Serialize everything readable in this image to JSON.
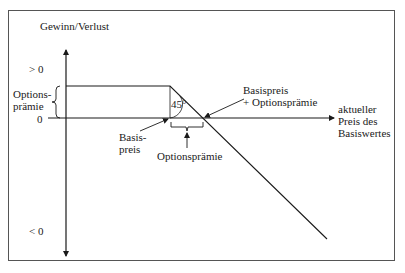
{
  "diagram": {
    "type": "payoff-diagram",
    "y_axis_label": "Gewinn/Verlust",
    "x_axis_label": "aktueller\nPreis des\nBasiswertes",
    "tick_positive": "> 0",
    "tick_zero": "0",
    "tick_negative": "< 0",
    "bracket_left_label": "Options-\nprämie",
    "angle_label": "45°",
    "strike_label": "Basis-\npreis",
    "breakeven_label": "Basispreis\n+ Optionsprämie",
    "premium_bottom_label": "Optionsprämie",
    "colors": {
      "line": "#1a1a1a",
      "frame": "#555555",
      "background": "#ffffff"
    }
  }
}
